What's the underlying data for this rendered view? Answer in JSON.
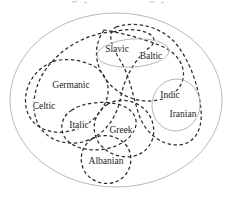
{
  "diagram": {
    "background_color": "#ffffff",
    "outer_boundary": {
      "name": "Indo-European",
      "shape": "ellipse",
      "stroke_color": "#b9b9b9",
      "stroke_style": "solid",
      "cx": 116,
      "cy": 100,
      "rx": 106,
      "ry": 87
    },
    "branch_labels": [
      {
        "id": "slavic",
        "text": "Slavic",
        "x": 117,
        "y": 50
      },
      {
        "id": "baltic",
        "text": "Baltic",
        "x": 151,
        "y": 57
      },
      {
        "id": "germanic",
        "text": "Germanic",
        "x": 71,
        "y": 86
      },
      {
        "id": "celtic",
        "text": "Celtic",
        "x": 44,
        "y": 107
      },
      {
        "id": "italic",
        "text": "Italic",
        "x": 79,
        "y": 126
      },
      {
        "id": "greek",
        "text": "Greek",
        "x": 121,
        "y": 131
      },
      {
        "id": "albanian",
        "text": "Albanian",
        "x": 106,
        "y": 162
      },
      {
        "id": "indic",
        "text": "Indic",
        "x": 170,
        "y": 96
      },
      {
        "id": "iranian",
        "text": "Iranian",
        "x": 183,
        "y": 115
      }
    ],
    "solid_subgroups": [
      {
        "id": "balto-slavic",
        "members": [
          "Slavic",
          "Baltic"
        ],
        "cx": 133,
        "cy": 53,
        "rx": 36,
        "ry": 14,
        "rotation": -4
      },
      {
        "id": "indo-iranian",
        "members": [
          "Indic",
          "Iranian"
        ],
        "cx": 176,
        "cy": 105,
        "rx": 24,
        "ry": 26,
        "rotation": 8
      }
    ],
    "dashed_loops": [
      {
        "id": "loop-germanic-celtic-italic"
      },
      {
        "id": "loop-celtic-italic-albanian"
      },
      {
        "id": "loop-slavic-germanic-sweep"
      },
      {
        "id": "loop-balto-slavic-indo-iranian-sweep"
      },
      {
        "id": "loop-greek-albanian"
      },
      {
        "id": "loop-italic-greek"
      },
      {
        "id": "loop-albanian"
      }
    ],
    "legend": {
      "dashed_meaning": "isogloss / shared-feature grouping",
      "solid_meaning": "established sub-family"
    }
  }
}
